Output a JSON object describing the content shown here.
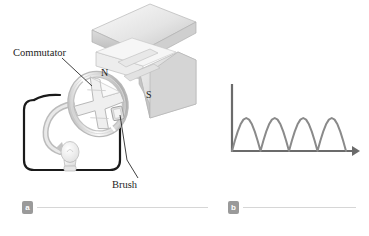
{
  "figure": {
    "background_color": "#ffffff",
    "panels": [
      {
        "key": "a",
        "badge": "a",
        "title": "DC generator with commutator"
      },
      {
        "key": "b",
        "badge": "b",
        "title": "Rectified emf versus time"
      }
    ]
  },
  "panel_a": {
    "labels": {
      "commutator": "Commutator",
      "brush": "Brush",
      "north_pole": "N",
      "south_pole": "S"
    },
    "colors": {
      "magnet_light": "#f2f2f2",
      "magnet_mid": "#d8d8d8",
      "magnet_dark": "#b4b4b4",
      "circuit_wire": "#1a1a1a",
      "commutator_metal": "#e2e2e2",
      "leader_line": "#2a2a2a"
    },
    "parts": {
      "commutator_ring": "split-ring-commutator",
      "armature": "cross-shaped-armature-core",
      "bulb": "light-bulb",
      "rotation_arrow": "rotation-direction-arrow",
      "circuit_loop": "external-circuit-loop"
    }
  },
  "panel_b": {
    "axis_labels": {
      "y": "ε",
      "x": "t"
    },
    "colors": {
      "axis": "#6b6b6b",
      "curve": "#8a8a8a"
    }
  },
  "chart_data": {
    "type": "line",
    "title": "",
    "xlabel": "t",
    "ylabel": "ε",
    "waveform": "rectified-sine",
    "cycles_shown": 4,
    "amplitude": 1.0,
    "period": 1.0,
    "xlim": [
      0,
      4.3
    ],
    "ylim": [
      0,
      1.35
    ],
    "grid": false,
    "legend": false,
    "tick_labels_x": [],
    "tick_labels_y": [],
    "x": [
      0,
      0.1,
      0.2,
      0.3,
      0.4,
      0.5,
      0.6,
      0.7,
      0.8,
      0.9,
      1.0,
      1.1,
      1.2,
      1.3,
      1.4,
      1.5,
      1.6,
      1.7,
      1.8,
      1.9,
      2.0,
      2.1,
      2.2,
      2.3,
      2.4,
      2.5,
      2.6,
      2.7,
      2.8,
      2.9,
      3.0,
      3.1,
      3.2,
      3.3,
      3.4,
      3.5,
      3.6,
      3.7,
      3.8,
      3.9,
      4.0
    ],
    "values": [
      0,
      0.309,
      0.588,
      0.809,
      0.951,
      1.0,
      0.951,
      0.809,
      0.588,
      0.309,
      0,
      0.309,
      0.588,
      0.809,
      0.951,
      1.0,
      0.951,
      0.809,
      0.588,
      0.309,
      0,
      0.309,
      0.588,
      0.809,
      0.951,
      1.0,
      0.951,
      0.809,
      0.588,
      0.309,
      0,
      0.309,
      0.588,
      0.809,
      0.951,
      1.0,
      0.951,
      0.809,
      0.588,
      0.309,
      0
    ]
  }
}
